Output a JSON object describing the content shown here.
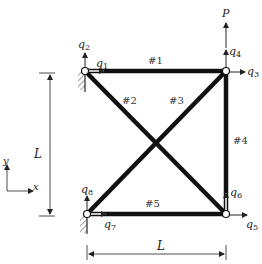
{
  "diagram": {
    "colors": {
      "member": "#111111",
      "line": "#222222",
      "background": "#ffffff"
    },
    "load": {
      "label": "P"
    },
    "dofs": [
      {
        "id": "q1",
        "base": "q",
        "sub": "1"
      },
      {
        "id": "q2",
        "base": "q",
        "sub": "2"
      },
      {
        "id": "q3",
        "base": "q",
        "sub": "3"
      },
      {
        "id": "q4",
        "base": "q",
        "sub": "4"
      },
      {
        "id": "q5",
        "base": "q",
        "sub": "5"
      },
      {
        "id": "q6",
        "base": "q",
        "sub": "6"
      },
      {
        "id": "q7",
        "base": "q",
        "sub": "7"
      },
      {
        "id": "q8",
        "base": "q",
        "sub": "8"
      }
    ],
    "members": [
      {
        "label": "#1"
      },
      {
        "label": "#2"
      },
      {
        "label": "#3"
      },
      {
        "label": "#4"
      },
      {
        "label": "#5"
      }
    ],
    "dimensions": {
      "height_label": "L",
      "width_label": "L"
    },
    "axes": {
      "x_label": "x",
      "y_label": "y"
    }
  }
}
